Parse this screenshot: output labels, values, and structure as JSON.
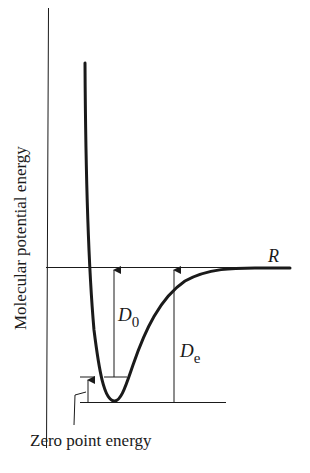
{
  "diagram": {
    "y_axis_label": "Molecular potential energy",
    "x_axis_label": "R",
    "labels": {
      "d0_main": "D",
      "d0_sub": "0",
      "de_main": "D",
      "de_sub": "e",
      "zero_point": "Zero point energy"
    },
    "colors": {
      "line": "#1a1a1a",
      "background": "#ffffff"
    }
  }
}
